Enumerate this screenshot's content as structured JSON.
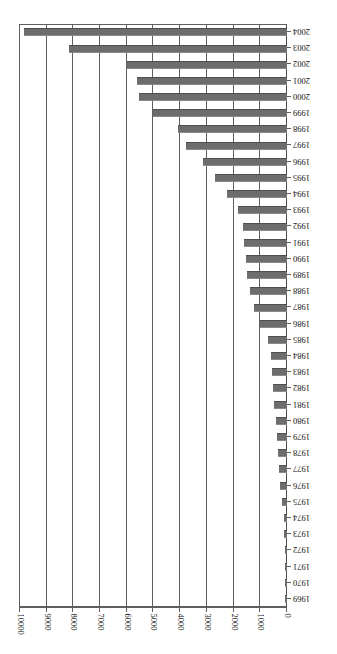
{
  "chart": {
    "type": "bar",
    "orientation": "horizontal",
    "rotated_180": true,
    "title": "",
    "subtitle": "",
    "xlabel": "",
    "ylabel": "",
    "bar_color": "#6d6d6d",
    "grid_color": "#5f5f5f",
    "background": "#ffffff",
    "legend": null
  },
  "chart_data": {
    "type": "bar",
    "title": "",
    "xlabel": "",
    "ylabel": "",
    "xlim": [
      0,
      10000
    ],
    "ylim": null,
    "grid": true,
    "legend_position": "none",
    "value_ticks": [
      0,
      1000,
      2000,
      3000,
      4000,
      5000,
      6000,
      7000,
      8000,
      9000,
      10000
    ],
    "value_tick_labels": [
      "0",
      "1000",
      "2000",
      "3000",
      "4000",
      "5000",
      "6000",
      "7000",
      "8000",
      "9000",
      "10000"
    ],
    "categories": [
      "1969",
      "1970",
      "1971",
      "1972",
      "1973",
      "1974",
      "1975",
      "1976",
      "1977",
      "1978",
      "1979",
      "1980",
      "1981",
      "1982",
      "1983",
      "1984",
      "1985",
      "1986",
      "1987",
      "1988",
      "1989",
      "1990",
      "1991",
      "1992",
      "1993",
      "1994",
      "1995",
      "1996",
      "1997",
      "1998",
      "1999",
      "2000",
      "2001",
      "2002",
      "2003",
      "2004"
    ],
    "values": [
      30,
      40,
      60,
      90,
      110,
      130,
      170,
      260,
      290,
      320,
      370,
      420,
      480,
      520,
      560,
      600,
      700,
      1000,
      1250,
      1400,
      1500,
      1550,
      1600,
      1650,
      1850,
      2250,
      2700,
      3150,
      3800,
      4100,
      5000,
      5550,
      5600,
      6000,
      8150,
      9850
    ]
  }
}
